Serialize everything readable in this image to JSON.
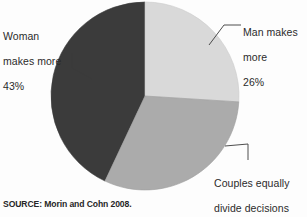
{
  "figure": {
    "background": "#fdfdfd",
    "source_note": "SOURCE: Morin and Cohn 2008."
  },
  "chart_data": {
    "type": "pie",
    "title": "",
    "subtitle": "",
    "xlabel": "",
    "ylabel": "",
    "legend_position": "callout-labels",
    "grid": false,
    "units": "percent",
    "total": 100,
    "center": {
      "x": 145,
      "y": 96
    },
    "radius": 94,
    "start_angle_deg": 0,
    "direction": "clockwise",
    "categories": [
      "Man makes more",
      "Couples equally divide decisions",
      "Woman makes more"
    ],
    "values": [
      26,
      31,
      43
    ],
    "colors": [
      "#d9d9d9",
      "#ababab",
      "#3b3b3b"
    ],
    "slices": [
      {
        "name": "man-makes-more",
        "label_line1": "Man makes",
        "label_line2": "more",
        "label_line3": "26%",
        "value": 26,
        "value_text": "26%",
        "color": "#d9d9d9",
        "start_deg": 0,
        "end_deg": 93.6
      },
      {
        "name": "couples-equally-divide",
        "label_line1": "Couples equally",
        "label_line2": "divide decisions",
        "label_line3": "31%",
        "value": 31,
        "value_text": "31%",
        "color": "#ababab",
        "start_deg": 93.6,
        "end_deg": 205.2
      },
      {
        "name": "woman-makes-more",
        "label_line1": "Woman",
        "label_line2": "makes more",
        "label_line3": "43%",
        "value": 43,
        "value_text": "43%",
        "color": "#3b3b3b",
        "start_deg": 205.2,
        "end_deg": 360
      }
    ]
  }
}
